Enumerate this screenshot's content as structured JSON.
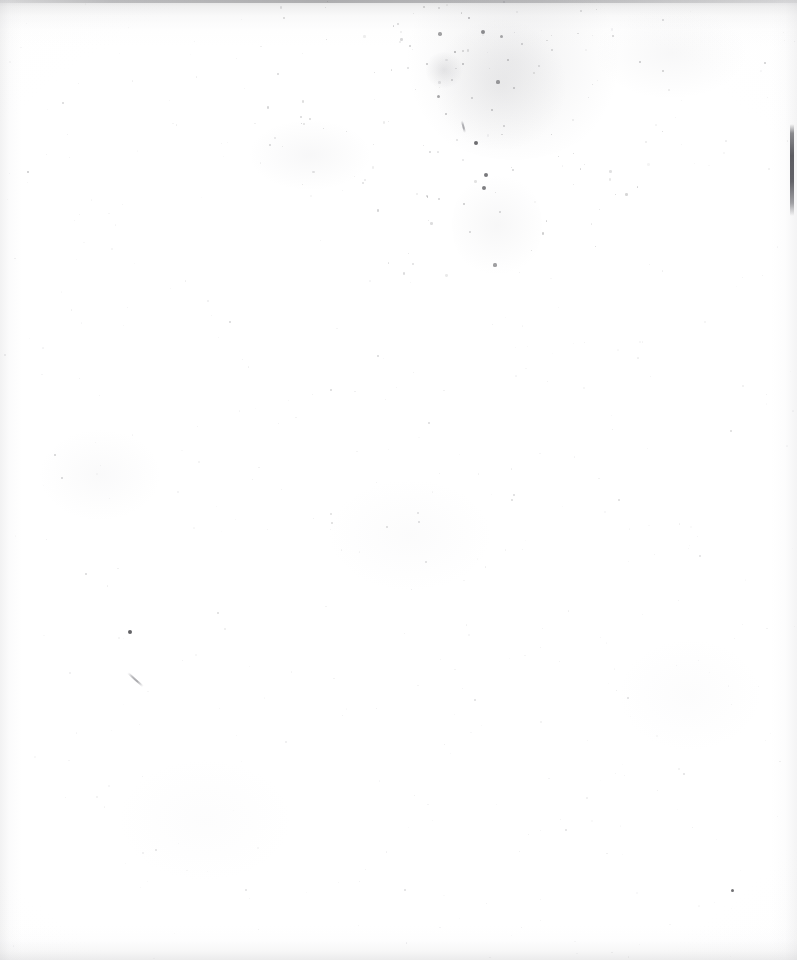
{
  "document": {
    "kind": "scanned-page",
    "content_summary": "Blank scanned page — no printed or handwritten text is visible",
    "page_text": "",
    "width_px": 797,
    "height_px": 960,
    "background_color": "#ffffff",
    "paper_tone_color": "#fbfbfb",
    "ink_color": "#4a4a4e",
    "edge_shadow_color": "#9a9a9e"
  },
  "artifacts": {
    "top_edge_band": {
      "label": "",
      "y": 0,
      "height": 46,
      "color": "#9a9a9e"
    },
    "bottom_edge_band": {
      "label": "",
      "y": 926,
      "height": 34,
      "color": "#b2b2b5"
    },
    "right_edge_streak": {
      "label": "",
      "x": 790,
      "y": 124,
      "width": 4,
      "height": 92,
      "color": "#4a4a50"
    },
    "speckle_cluster": {
      "label": "",
      "center_x": 470,
      "center_y": 80,
      "radius": 130
    },
    "halos": [
      {
        "x": 398,
        "y": -40,
        "w": 230,
        "h": 200,
        "color": "rgba(168,168,172,0.16)"
      },
      {
        "x": 430,
        "y": 20,
        "w": 140,
        "h": 130,
        "color": "rgba(155,155,160,0.14)"
      },
      {
        "x": 452,
        "y": 170,
        "w": 90,
        "h": 110,
        "color": "rgba(178,178,183,0.10)"
      },
      {
        "x": 424,
        "y": 52,
        "w": 40,
        "h": 36,
        "color": "rgba(150,150,156,0.22)"
      }
    ],
    "blotches": [
      {
        "x": 250,
        "y": 120,
        "w": 120,
        "h": 70,
        "color": "rgba(210,210,214,0.16)"
      },
      {
        "x": 596,
        "y": 8,
        "w": 150,
        "h": 90,
        "color": "rgba(206,206,210,0.15)"
      },
      {
        "x": 40,
        "y": 430,
        "w": 120,
        "h": 90,
        "color": "rgba(216,216,220,0.13)"
      },
      {
        "x": 330,
        "y": 480,
        "w": 160,
        "h": 110,
        "color": "rgba(220,220,224,0.10)"
      },
      {
        "x": 620,
        "y": 640,
        "w": 140,
        "h": 110,
        "color": "rgba(222,222,226,0.09)"
      },
      {
        "x": 120,
        "y": 760,
        "w": 170,
        "h": 120,
        "color": "rgba(224,224,228,0.08)"
      }
    ],
    "specks": [
      {
        "x": 476,
        "y": 143,
        "d": 4.6,
        "o": 0.8
      },
      {
        "x": 486,
        "y": 175,
        "d": 4.2,
        "o": 0.74
      },
      {
        "x": 484,
        "y": 188,
        "d": 4.0,
        "o": 0.7
      },
      {
        "x": 495,
        "y": 265,
        "d": 3.2,
        "o": 0.52
      },
      {
        "x": 130,
        "y": 632,
        "d": 4.4,
        "o": 0.86
      },
      {
        "x": 732,
        "y": 890,
        "d": 3.0,
        "o": 0.78
      },
      {
        "x": 483,
        "y": 32,
        "d": 4.0,
        "o": 0.62
      },
      {
        "x": 440,
        "y": 34,
        "d": 3.4,
        "o": 0.5
      },
      {
        "x": 501,
        "y": 36,
        "d": 3.0,
        "o": 0.46
      },
      {
        "x": 455,
        "y": 52,
        "d": 2.8,
        "o": 0.42
      },
      {
        "x": 469,
        "y": 18,
        "d": 2.6,
        "o": 0.4
      },
      {
        "x": 498,
        "y": 82,
        "d": 3.2,
        "o": 0.52
      },
      {
        "x": 438,
        "y": 96,
        "d": 3.0,
        "o": 0.48
      },
      {
        "x": 463,
        "y": 64,
        "d": 2.4,
        "o": 0.36
      },
      {
        "x": 508,
        "y": 60,
        "d": 2.2,
        "o": 0.33
      },
      {
        "x": 427,
        "y": 64,
        "d": 2.2,
        "o": 0.32
      },
      {
        "x": 446,
        "y": 114,
        "d": 2.4,
        "o": 0.34
      },
      {
        "x": 492,
        "y": 110,
        "d": 2.2,
        "o": 0.32
      },
      {
        "x": 514,
        "y": 88,
        "d": 2.0,
        "o": 0.3
      },
      {
        "x": 410,
        "y": 46,
        "d": 2.0,
        "o": 0.28
      },
      {
        "x": 522,
        "y": 44,
        "d": 2.0,
        "o": 0.28
      },
      {
        "x": 472,
        "y": 98,
        "d": 1.8,
        "o": 0.26
      },
      {
        "x": 452,
        "y": 80,
        "d": 1.8,
        "o": 0.25
      },
      {
        "x": 504,
        "y": 126,
        "d": 2.0,
        "o": 0.27
      },
      {
        "x": 464,
        "y": 204,
        "d": 2.2,
        "o": 0.3
      },
      {
        "x": 470,
        "y": 232,
        "d": 1.8,
        "o": 0.24
      },
      {
        "x": 500,
        "y": 212,
        "d": 1.8,
        "o": 0.24
      },
      {
        "x": 513,
        "y": 170,
        "d": 1.8,
        "o": 0.23
      },
      {
        "x": 430,
        "y": 152,
        "d": 1.8,
        "o": 0.23
      },
      {
        "x": 427,
        "y": 196,
        "d": 1.6,
        "o": 0.2
      },
      {
        "x": 552,
        "y": 50,
        "d": 1.8,
        "o": 0.22
      },
      {
        "x": 398,
        "y": 24,
        "d": 1.8,
        "o": 0.22
      },
      {
        "x": 640,
        "y": 62,
        "d": 2.0,
        "o": 0.3
      },
      {
        "x": 765,
        "y": 63,
        "d": 2.0,
        "o": 0.28
      },
      {
        "x": 613,
        "y": 36,
        "d": 1.6,
        "o": 0.22
      },
      {
        "x": 663,
        "y": 20,
        "d": 1.6,
        "o": 0.2
      },
      {
        "x": 28,
        "y": 172,
        "d": 2.2,
        "o": 0.3
      },
      {
        "x": 55,
        "y": 455,
        "d": 2.0,
        "o": 0.26
      },
      {
        "x": 62,
        "y": 478,
        "d": 2.0,
        "o": 0.25
      },
      {
        "x": 86,
        "y": 574,
        "d": 1.8,
        "o": 0.22
      },
      {
        "x": 63,
        "y": 103,
        "d": 1.6,
        "o": 0.2
      },
      {
        "x": 270,
        "y": 145,
        "d": 1.8,
        "o": 0.23
      },
      {
        "x": 301,
        "y": 117,
        "d": 1.6,
        "o": 0.2
      },
      {
        "x": 230,
        "y": 322,
        "d": 1.8,
        "o": 0.22
      },
      {
        "x": 378,
        "y": 356,
        "d": 1.6,
        "o": 0.2
      },
      {
        "x": 331,
        "y": 390,
        "d": 1.8,
        "o": 0.21
      },
      {
        "x": 429,
        "y": 423,
        "d": 1.6,
        "o": 0.19
      },
      {
        "x": 514,
        "y": 495,
        "d": 1.6,
        "o": 0.19
      },
      {
        "x": 387,
        "y": 527,
        "d": 1.8,
        "o": 0.2
      },
      {
        "x": 419,
        "y": 522,
        "d": 1.6,
        "o": 0.18
      },
      {
        "x": 512,
        "y": 500,
        "d": 1.6,
        "o": 0.18
      },
      {
        "x": 619,
        "y": 500,
        "d": 1.6,
        "o": 0.18
      },
      {
        "x": 332,
        "y": 523,
        "d": 1.6,
        "o": 0.18
      },
      {
        "x": 731,
        "y": 431,
        "d": 1.6,
        "o": 0.18
      },
      {
        "x": 418,
        "y": 513,
        "d": 1.4,
        "o": 0.16
      },
      {
        "x": 218,
        "y": 613,
        "d": 1.6,
        "o": 0.18
      },
      {
        "x": 331,
        "y": 514,
        "d": 1.4,
        "o": 0.16
      },
      {
        "x": 426,
        "y": 562,
        "d": 1.6,
        "o": 0.17
      },
      {
        "x": 628,
        "y": 698,
        "d": 1.6,
        "o": 0.17
      },
      {
        "x": 475,
        "y": 700,
        "d": 1.6,
        "o": 0.17
      },
      {
        "x": 405,
        "y": 890,
        "d": 1.6,
        "o": 0.17
      },
      {
        "x": 246,
        "y": 890,
        "d": 1.4,
        "o": 0.15
      },
      {
        "x": 566,
        "y": 830,
        "d": 1.4,
        "o": 0.15
      },
      {
        "x": 684,
        "y": 774,
        "d": 1.4,
        "o": 0.15
      },
      {
        "x": 156,
        "y": 850,
        "d": 1.4,
        "o": 0.15
      },
      {
        "x": 700,
        "y": 556,
        "d": 1.4,
        "o": 0.15
      }
    ],
    "strokes": [
      {
        "x": 128,
        "y": 672,
        "w": 20,
        "h": 2.0,
        "rot": 42
      },
      {
        "x": 462,
        "y": 120,
        "w": 12,
        "h": 1.6,
        "rot": 75
      }
    ]
  }
}
